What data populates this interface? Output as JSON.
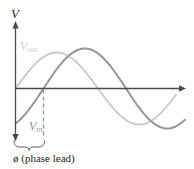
{
  "figure": {
    "y_axis_label": "V",
    "vout_label": {
      "main": "V",
      "sub": "out"
    },
    "vin_label": {
      "main": "V",
      "sub": "in"
    },
    "phase_annotation": "ø (phase lead)"
  },
  "colors": {
    "background": "#ffffff",
    "axis": "#4a4a4a",
    "vout_curve": "#c5ccc3",
    "vout_label": "#cdd3ca",
    "vin_curve": "#91979b",
    "vin_label": "#8d9399",
    "dashed_line": "#8f8f8f",
    "brace": "#4a4a4a",
    "text": "#1e1e1e"
  },
  "geometry": {
    "axis_y": 88.5,
    "origin_x": 15.5,
    "waves": {
      "v_out": {
        "phase_x": 15.5,
        "amplitude": 36,
        "period": 165,
        "x_start": 15.5,
        "x_end": 177
      },
      "v_in": {
        "phase_x": 43.5,
        "amplitude": 40,
        "period": 165,
        "x_start": 15.5,
        "x_end": 186
      }
    },
    "dashed_x": 43.5
  },
  "chart_data": {
    "type": "line",
    "title": "",
    "xlabel": "",
    "ylabel": "V",
    "series": [
      {
        "name": "Vout",
        "shape": "sinusoid",
        "role": "leading waveform"
      },
      {
        "name": "Vin",
        "shape": "sinusoid",
        "role": "lagging waveform"
      }
    ],
    "annotations": [
      "ø (phase lead)"
    ],
    "axes": {
      "x_ticks": [],
      "y_ticks": [],
      "grid": false
    }
  }
}
